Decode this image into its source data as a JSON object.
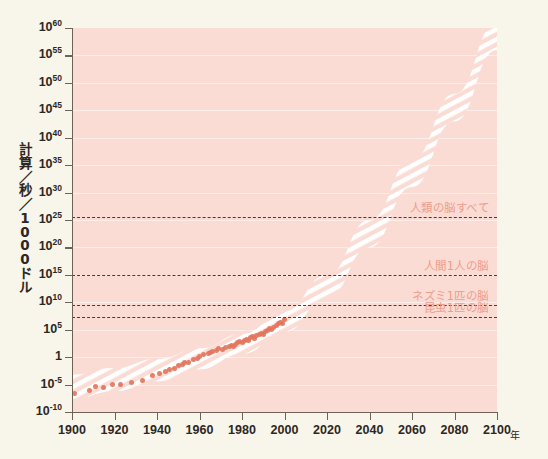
{
  "chart_data": {
    "type": "area",
    "title": "",
    "xlabel": "年",
    "ylabel": "計算／秒／1000ドル",
    "ylabel_chars": [
      "計",
      "算",
      "／",
      "秒",
      "／",
      "1",
      "0",
      "0",
      "0",
      "ド",
      "ル"
    ],
    "xlim": [
      1900,
      2100
    ],
    "ylim_log10": [
      -10,
      60
    ],
    "grid": true,
    "legend": "none",
    "x_ticks": [
      "1900",
      "1920",
      "1940",
      "1960",
      "1980",
      "2000",
      "2020",
      "2040",
      "2060",
      "2080",
      "2100"
    ],
    "x_tick_values": [
      1900,
      1920,
      1940,
      1960,
      1980,
      2000,
      2020,
      2040,
      2060,
      2080,
      2100
    ],
    "y_ticks": [
      {
        "mantissa": "10",
        "exponent": "60",
        "log10": 60
      },
      {
        "mantissa": "10",
        "exponent": "55",
        "log10": 55
      },
      {
        "mantissa": "10",
        "exponent": "50",
        "log10": 50
      },
      {
        "mantissa": "10",
        "exponent": "45",
        "log10": 45
      },
      {
        "mantissa": "10",
        "exponent": "40",
        "log10": 40
      },
      {
        "mantissa": "10",
        "exponent": "35",
        "log10": 35
      },
      {
        "mantissa": "10",
        "exponent": "30",
        "log10": 30
      },
      {
        "mantissa": "10",
        "exponent": "25",
        "log10": 25
      },
      {
        "mantissa": "10",
        "exponent": "20",
        "log10": 20
      },
      {
        "mantissa": "10",
        "exponent": "15",
        "log10": 15
      },
      {
        "mantissa": "10",
        "exponent": "10",
        "log10": 10
      },
      {
        "mantissa": "10",
        "exponent": "5",
        "log10": 5
      },
      {
        "mantissa": "1",
        "exponent": "",
        "log10": 0
      },
      {
        "mantissa": "10",
        "exponent": "-5",
        "log10": -5
      },
      {
        "mantissa": "10",
        "exponent": "-10",
        "log10": -10
      }
    ],
    "threshold_lines": [
      {
        "label": "人類の脳すべて",
        "log10": 25.6
      },
      {
        "label": "人間1人の脳",
        "log10": 15.0
      },
      {
        "label": "ネズミ1匹の脳",
        "log10": 9.6
      },
      {
        "label": "昆虫1匹の脳",
        "log10": 7.3
      }
    ],
    "band": {
      "name": "計算能力の推移帯",
      "description": "ムーアの法則に沿った指数的成長を示すハッチング帯",
      "upper_points": [
        {
          "x": 1900,
          "log10y": -3.2
        },
        {
          "x": 1920,
          "log10y": -2.0
        },
        {
          "x": 1940,
          "log10y": -0.3
        },
        {
          "x": 1960,
          "log10y": 1.6
        },
        {
          "x": 1980,
          "log10y": 4.2
        },
        {
          "x": 2000,
          "log10y": 8.4
        },
        {
          "x": 2020,
          "log10y": 15.0
        },
        {
          "x": 2040,
          "log10y": 25.0
        },
        {
          "x": 2060,
          "log10y": 36.0
        },
        {
          "x": 2080,
          "log10y": 48.0
        },
        {
          "x": 2100,
          "log10y": 61.0
        }
      ],
      "lower_points": [
        {
          "x": 1900,
          "log10y": -7.6
        },
        {
          "x": 1920,
          "log10y": -6.2
        },
        {
          "x": 1940,
          "log10y": -4.4
        },
        {
          "x": 1960,
          "log10y": -2.2
        },
        {
          "x": 1980,
          "log10y": 0.6
        },
        {
          "x": 2000,
          "log10y": 4.6
        },
        {
          "x": 2020,
          "log10y": 10.8
        },
        {
          "x": 2040,
          "log10y": 20.0
        },
        {
          "x": 2060,
          "log10y": 31.0
        },
        {
          "x": 2080,
          "log10y": 43.0
        },
        {
          "x": 2100,
          "log10y": 56.0
        }
      ]
    },
    "data_points": [
      {
        "x": 1901,
        "log10y": -6.6
      },
      {
        "x": 1908,
        "log10y": -6.0
      },
      {
        "x": 1911,
        "log10y": -5.3
      },
      {
        "x": 1915,
        "log10y": -5.6
      },
      {
        "x": 1919,
        "log10y": -5.0
      },
      {
        "x": 1923,
        "log10y": -4.9
      },
      {
        "x": 1928,
        "log10y": -4.6
      },
      {
        "x": 1933,
        "log10y": -4.2
      },
      {
        "x": 1938,
        "log10y": -3.4
      },
      {
        "x": 1941,
        "log10y": -3.0
      },
      {
        "x": 1944,
        "log10y": -2.6
      },
      {
        "x": 1946,
        "log10y": -2.3
      },
      {
        "x": 1948,
        "log10y": -2.0
      },
      {
        "x": 1950,
        "log10y": -1.6
      },
      {
        "x": 1952,
        "log10y": -1.3
      },
      {
        "x": 1953,
        "log10y": -1.0
      },
      {
        "x": 1955,
        "log10y": -0.9
      },
      {
        "x": 1957,
        "log10y": -0.5
      },
      {
        "x": 1959,
        "log10y": -0.2
      },
      {
        "x": 1960,
        "log10y": 0.2
      },
      {
        "x": 1962,
        "log10y": 0.4
      },
      {
        "x": 1964,
        "log10y": 0.6
      },
      {
        "x": 1965,
        "log10y": 0.9
      },
      {
        "x": 1966,
        "log10y": 1.1
      },
      {
        "x": 1968,
        "log10y": 1.3
      },
      {
        "x": 1969,
        "log10y": 1.5
      },
      {
        "x": 1971,
        "log10y": 1.4
      },
      {
        "x": 1972,
        "log10y": 1.7
      },
      {
        "x": 1974,
        "log10y": 1.9
      },
      {
        "x": 1975,
        "log10y": 2.2
      },
      {
        "x": 1976,
        "log10y": 2.0
      },
      {
        "x": 1977,
        "log10y": 2.4
      },
      {
        "x": 1978,
        "log10y": 2.6
      },
      {
        "x": 1979,
        "log10y": 2.9
      },
      {
        "x": 1980,
        "log10y": 2.7
      },
      {
        "x": 1981,
        "log10y": 3.1
      },
      {
        "x": 1982,
        "log10y": 3.3
      },
      {
        "x": 1983,
        "log10y": 3.0
      },
      {
        "x": 1984,
        "log10y": 3.5
      },
      {
        "x": 1985,
        "log10y": 3.7
      },
      {
        "x": 1986,
        "log10y": 3.4
      },
      {
        "x": 1987,
        "log10y": 3.9
      },
      {
        "x": 1988,
        "log10y": 4.1
      },
      {
        "x": 1989,
        "log10y": 4.4
      },
      {
        "x": 1990,
        "log10y": 4.2
      },
      {
        "x": 1991,
        "log10y": 4.7
      },
      {
        "x": 1992,
        "log10y": 4.9
      },
      {
        "x": 1993,
        "log10y": 5.2
      },
      {
        "x": 1994,
        "log10y": 5.0
      },
      {
        "x": 1995,
        "log10y": 5.5
      },
      {
        "x": 1996,
        "log10y": 5.8
      },
      {
        "x": 1997,
        "log10y": 6.1
      },
      {
        "x": 1998,
        "log10y": 6.4
      },
      {
        "x": 1999,
        "log10y": 6.2
      },
      {
        "x": 2000,
        "log10y": 6.8
      }
    ]
  },
  "colors": {
    "page_background": "#f8f5ea",
    "plot_background": "#fadcd4",
    "gridline": "#fdeee9",
    "band_stripe": "#ffffff",
    "dot": "#e3755c",
    "annotation_text": "#ef9c8a",
    "axis": "#6b6258",
    "tick_text": "#2c2723",
    "threshold_dash": "#4a3a33"
  }
}
